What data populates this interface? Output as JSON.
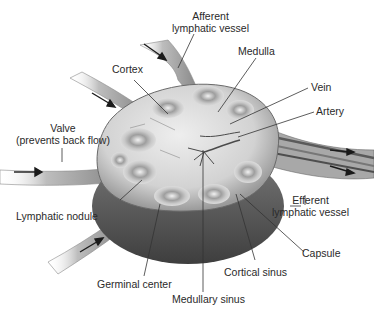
{
  "colors": {
    "background": "#ffffff",
    "tissue_light": "#e4e4e4",
    "tissue_mid": "#b8b8b8",
    "tissue_dark": "#5a5a5a",
    "capsule": "#4a4a4a",
    "leader_line": "#333333",
    "label_text": "#2a2a2a"
  },
  "labels": {
    "afferent": {
      "line1": "Afferent",
      "line2": "lymphatic vessel"
    },
    "medulla": "Medulla",
    "cortex": "Cortex",
    "vein": "Vein",
    "artery": "Artery",
    "valve": {
      "line1": "Valve",
      "line2": "(prevents back flow)"
    },
    "efferent": {
      "line1": "Efferent",
      "line2": "lymphatic vessel"
    },
    "lymphatic_nodule": "Lymphatic nodule",
    "capsule": "Capsule",
    "cortical_sinus": "Cortical sinus",
    "germinal_center": "Germinal center",
    "medullary_sinus": "Medullary sinus"
  }
}
